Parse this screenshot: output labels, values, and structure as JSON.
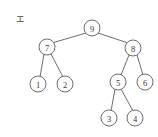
{
  "figure": {
    "label": "エ",
    "caption_position": "top-left",
    "background_color": "#ffffff",
    "stroke_color": "#5c5c5c",
    "text_color": "#3a3a3a"
  },
  "chart_data": {
    "type": "diagram",
    "diagram_type": "binary-tree",
    "title": "エ",
    "xlabel": "",
    "ylabel": "",
    "grid": false,
    "legend": false,
    "root": "9",
    "nodes": [
      {
        "id": "n9",
        "label": "9",
        "x": 92,
        "y": 28,
        "radius": 8,
        "level": 0
      },
      {
        "id": "n7",
        "label": "7",
        "x": 47,
        "y": 47,
        "radius": 8,
        "level": 1
      },
      {
        "id": "n8",
        "label": "8",
        "x": 133,
        "y": 48,
        "radius": 8,
        "level": 1
      },
      {
        "id": "n1",
        "label": "1",
        "x": 38,
        "y": 84,
        "radius": 8,
        "level": 2
      },
      {
        "id": "n2",
        "label": "2",
        "x": 65,
        "y": 84,
        "radius": 8,
        "level": 2
      },
      {
        "id": "n5",
        "label": "5",
        "x": 118,
        "y": 82,
        "radius": 8,
        "level": 2
      },
      {
        "id": "n6",
        "label": "6",
        "x": 145,
        "y": 82,
        "radius": 8,
        "level": 2
      },
      {
        "id": "n3",
        "label": "3",
        "x": 109,
        "y": 118,
        "radius": 8,
        "level": 3
      },
      {
        "id": "n4",
        "label": "4",
        "x": 135,
        "y": 118,
        "radius": 8,
        "level": 3
      }
    ],
    "edges": [
      {
        "from": "n9",
        "to": "n7",
        "x1": 86,
        "y1": 33,
        "x2": 52,
        "y2": 43
      },
      {
        "from": "n9",
        "to": "n8",
        "x1": 98,
        "y1": 33,
        "x2": 128,
        "y2": 43
      },
      {
        "from": "n7",
        "to": "n1",
        "x1": 44,
        "y1": 54,
        "x2": 40,
        "y2": 77
      },
      {
        "from": "n7",
        "to": "n2",
        "x1": 51,
        "y1": 54,
        "x2": 63,
        "y2": 77
      },
      {
        "from": "n8",
        "to": "n5",
        "x1": 129,
        "y1": 55,
        "x2": 121,
        "y2": 75
      },
      {
        "from": "n8",
        "to": "n6",
        "x1": 137,
        "y1": 55,
        "x2": 143,
        "y2": 75
      },
      {
        "from": "n5",
        "to": "n3",
        "x1": 115,
        "y1": 89,
        "x2": 111,
        "y2": 111
      },
      {
        "from": "n5",
        "to": "n4",
        "x1": 121,
        "y1": 89,
        "x2": 133,
        "y2": 111
      }
    ]
  },
  "label_marker": {
    "text": "エ",
    "x": 20,
    "y": 19
  }
}
